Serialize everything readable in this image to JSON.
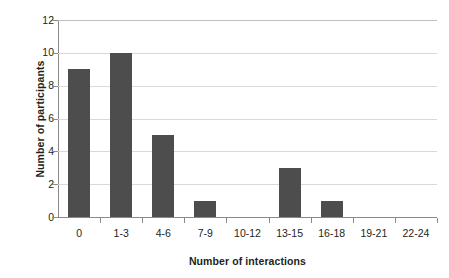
{
  "chart_data": {
    "type": "bar",
    "title": "",
    "xlabel": "Number of interactions",
    "ylabel": "Number of participants",
    "categories": [
      "0",
      "1-3",
      "4-6",
      "7-9",
      "10-12",
      "13-15",
      "16-18",
      "19-21",
      "22-24"
    ],
    "values": [
      9,
      10,
      5,
      1,
      0,
      3,
      1,
      0,
      0
    ],
    "ylim": [
      0,
      12
    ],
    "yticks": [
      0,
      2,
      4,
      6,
      8,
      10,
      12
    ],
    "grid": true,
    "legend": "none",
    "bar_color": "#4d4d4d",
    "gridline_color": "#d9d9d9",
    "axis_color": "#8a8a8a",
    "background_color": "#ffffff"
  }
}
